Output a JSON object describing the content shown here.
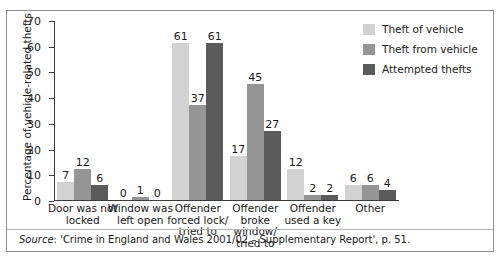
{
  "figure": {
    "cut_title_fragment": "",
    "source_prefix": "Source",
    "source_text": ": 'Crime in England and Wales 2001/02 – Supplementary Report', p. 51."
  },
  "legend": {
    "items": [
      {
        "label": "Theft of vehicle",
        "color": "#d2d2d2"
      },
      {
        "label": "Theft from vehicle",
        "color": "#959595"
      },
      {
        "label": "Attempted thefts",
        "color": "#5b5b5b"
      }
    ]
  },
  "chart_data": {
    "type": "bar",
    "title": "",
    "xlabel": "",
    "ylabel": "Percentage of vehicle-related thefts",
    "ylim": [
      0,
      70
    ],
    "yticks": [
      0,
      10,
      20,
      30,
      40,
      50,
      60,
      70
    ],
    "ytick_labels": [
      "0",
      "10",
      "20",
      "30",
      "40",
      "50",
      "60",
      "70"
    ],
    "grid": false,
    "legend_position": "top-right",
    "categories": [
      "Door was not locked",
      "Window was left open",
      "Offender forced lock/ tried to",
      "Offender broke window/ tried to",
      "Offender used a key",
      "Other"
    ],
    "category_lines": [
      [
        "Door was not",
        "locked"
      ],
      [
        "Window was",
        "left open"
      ],
      [
        "Offender",
        "forced lock/",
        "tried to"
      ],
      [
        "Offender",
        "broke window/",
        "tried to"
      ],
      [
        "Offender",
        "used a key"
      ],
      [
        "Other"
      ]
    ],
    "series": [
      {
        "name": "Theft of vehicle",
        "color": "#d2d2d2",
        "values": [
          7,
          0,
          61,
          17,
          12,
          6
        ]
      },
      {
        "name": "Theft from vehicle",
        "color": "#959595",
        "values": [
          12,
          1,
          37,
          45,
          2,
          6
        ]
      },
      {
        "name": "Attempted thefts",
        "color": "#5b5b5b",
        "values": [
          6,
          0,
          61,
          27,
          2,
          4
        ]
      }
    ]
  }
}
